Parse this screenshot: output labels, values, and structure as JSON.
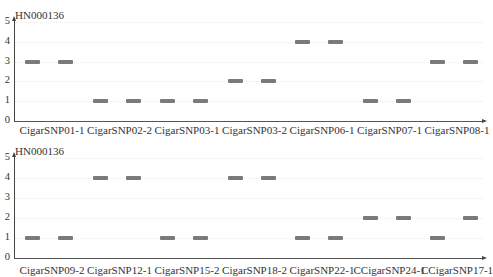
{
  "chart_data": [
    {
      "type": "scatter",
      "title": "HN000136",
      "xlabel": "",
      "ylabel": "",
      "ylim": [
        0,
        5
      ],
      "yticks": [
        0,
        1,
        2,
        3,
        4,
        5
      ],
      "grid": true,
      "categories": [
        "CigarSNP01-1",
        "CigarSNP02-2",
        "CigarSNP03-1",
        "CigarSNP03-2",
        "CigarSNP06-1",
        "CigarSNP07-1",
        "CigarSNP08-1"
      ],
      "series": [
        {
          "name": "band-1",
          "values": [
            3,
            1,
            1,
            2,
            4,
            1,
            3
          ]
        },
        {
          "name": "band-2",
          "values": [
            3,
            1,
            1,
            2,
            4,
            1,
            3
          ]
        }
      ]
    },
    {
      "type": "scatter",
      "title": "HN000136",
      "xlabel": "",
      "ylabel": "",
      "ylim": [
        0,
        5
      ],
      "yticks": [
        0,
        1,
        2,
        3,
        4,
        5
      ],
      "grid": true,
      "categories": [
        "CigarSNP09-2",
        "CigarSNP12-1",
        "CigarSNP15-2",
        "CigarSNP18-2",
        "CigarSNP22-1",
        "CCigarSNP24-1",
        "CCigarSNP17-1"
      ],
      "series": [
        {
          "name": "band-1",
          "values": [
            1,
            4,
            1,
            4,
            1,
            2,
            1
          ]
        },
        {
          "name": "band-2",
          "values": [
            1,
            4,
            1,
            4,
            1,
            2,
            2
          ]
        }
      ]
    }
  ],
  "panels": [
    {
      "gene": "HN000136",
      "yticks": [
        "5",
        "4",
        "3",
        "2",
        "1",
        "0"
      ],
      "labels": [
        "CigarSNP01-1",
        "CigarSNP02-2",
        "CigarSNP03-1",
        "CigarSNP03-2",
        "CigarSNP06-1",
        "CigarSNP07-1",
        "CigarSNP08-1"
      ]
    },
    {
      "gene": "HN000136",
      "yticks": [
        "5",
        "4",
        "3",
        "2",
        "1",
        "0"
      ],
      "labels": [
        "CigarSNP09-2",
        "CigarSNP12-1",
        "CigarSNP15-2",
        "CigarSNP18-2",
        "CigarSNP22-1",
        "CCigarSNP24-1",
        "CCigarSNP17-1"
      ]
    }
  ],
  "colors": {
    "band": "#7a7a7a",
    "axis": "#444444",
    "grid": "#ececec"
  }
}
